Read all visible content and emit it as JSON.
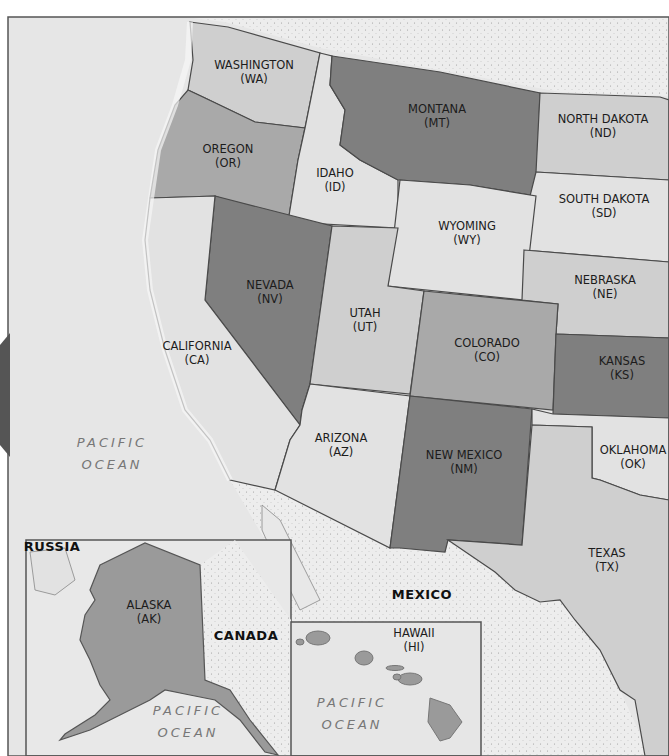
{
  "colors": {
    "ocean": "#e8e8e8",
    "foreign_land": "#ececec",
    "border": "#4a4a4a",
    "light": "#e2e2e2",
    "medium_light": "#cfcfcf",
    "medium": "#a9a9a9",
    "dark": "#7f7f7f",
    "tab": "#555555"
  },
  "states": [
    {
      "name": "WASHINGTON",
      "abbr": "(WA)",
      "x": 254,
      "y": 72,
      "shade": "medium_light"
    },
    {
      "name": "OREGON",
      "abbr": "(OR)",
      "x": 228,
      "y": 156,
      "shade": "medium"
    },
    {
      "name": "IDAHO",
      "abbr": "(ID)",
      "x": 335,
      "y": 180,
      "shade": "light"
    },
    {
      "name": "MONTANA",
      "abbr": "(MT)",
      "x": 437,
      "y": 116,
      "shade": "dark"
    },
    {
      "name": "NORTH DAKOTA",
      "abbr": "(ND)",
      "x": 603,
      "y": 126,
      "shade": "medium_light"
    },
    {
      "name": "SOUTH DAKOTA",
      "abbr": "(SD)",
      "x": 604,
      "y": 206,
      "shade": "light"
    },
    {
      "name": "WYOMING",
      "abbr": "(WY)",
      "x": 467,
      "y": 233,
      "shade": "light"
    },
    {
      "name": "NEBRASKA",
      "abbr": "(NE)",
      "x": 605,
      "y": 287,
      "shade": "medium_light"
    },
    {
      "name": "NEVADA",
      "abbr": "(NV)",
      "x": 270,
      "y": 292,
      "shade": "dark"
    },
    {
      "name": "UTAH",
      "abbr": "(UT)",
      "x": 365,
      "y": 320,
      "shade": "medium_light"
    },
    {
      "name": "COLORADO",
      "abbr": "(CO)",
      "x": 487,
      "y": 350,
      "shade": "medium"
    },
    {
      "name": "KANSAS",
      "abbr": "(KS)",
      "x": 622,
      "y": 368,
      "shade": "dark"
    },
    {
      "name": "CALIFORNIA",
      "abbr": "(CA)",
      "x": 197,
      "y": 353,
      "shade": "light"
    },
    {
      "name": "ARIZONA",
      "abbr": "(AZ)",
      "x": 341,
      "y": 445,
      "shade": "light"
    },
    {
      "name": "NEW MEXICO",
      "abbr": "(NM)",
      "x": 464,
      "y": 462,
      "shade": "dark"
    },
    {
      "name": "OKLAHOMA",
      "abbr": "(OK)",
      "x": 633,
      "y": 457,
      "shade": "light"
    },
    {
      "name": "TEXAS",
      "abbr": "(TX)",
      "x": 607,
      "y": 560,
      "shade": "medium_light"
    },
    {
      "name": "ALASKA",
      "abbr": "(AK)",
      "x": 149,
      "y": 612,
      "shade": "medium"
    },
    {
      "name": "HAWAII",
      "abbr": "(HI)",
      "x": 414,
      "y": 640,
      "shade": "medium"
    }
  ],
  "countries": [
    {
      "name": "RUSSIA",
      "x": 52,
      "y": 547
    },
    {
      "name": "CANADA",
      "x": 246,
      "y": 636
    },
    {
      "name": "MEXICO",
      "x": 422,
      "y": 595
    }
  ],
  "oceans": [
    {
      "line1": "PACIFIC",
      "line2": "OCEAN",
      "x": 112,
      "y": 432
    },
    {
      "line1": "PACIFIC",
      "line2": "OCEAN",
      "x": 188,
      "y": 700
    },
    {
      "line1": "PACIFIC",
      "line2": "OCEAN",
      "x": 352,
      "y": 692
    }
  ]
}
